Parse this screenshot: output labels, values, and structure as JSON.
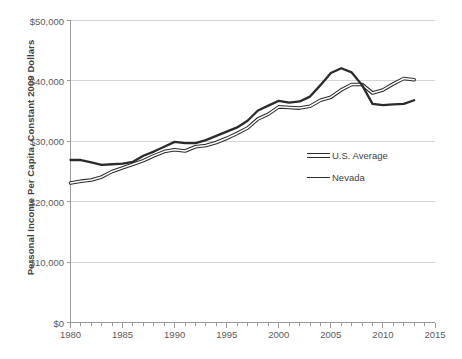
{
  "chart_data": {
    "type": "line",
    "title": "",
    "subtitle": "",
    "xlabel": "",
    "ylabel": "Personal Income Per Capita, Constant 2009 Dollars",
    "xlim": [
      1980,
      2015
    ],
    "ylim": [
      0,
      50000
    ],
    "grid": true,
    "grid_axis": "y",
    "legend_position": "inside-right-middle",
    "y_ticks": [
      0,
      10000,
      20000,
      30000,
      40000,
      50000
    ],
    "y_tick_labels": [
      "$0",
      "$10,000",
      "$20,000",
      "$30,000",
      "$40,000",
      "$50,000"
    ],
    "x_ticks_major": [
      1980,
      1985,
      1990,
      1995,
      2000,
      2005,
      2010,
      2015
    ],
    "x_tick_labels": [
      "1980",
      "1985",
      "1990",
      "1995",
      "2000",
      "2005",
      "2010",
      "2015"
    ],
    "x_minor_tick_interval": 1,
    "x": [
      1980,
      1981,
      1982,
      1983,
      1984,
      1985,
      1986,
      1987,
      1988,
      1989,
      1990,
      1991,
      1992,
      1993,
      1994,
      1995,
      1996,
      1997,
      1998,
      1999,
      2000,
      2001,
      2002,
      2003,
      2004,
      2005,
      2006,
      2007,
      2008,
      2009,
      2010,
      2011,
      2012,
      2013
    ],
    "series": [
      {
        "name": "U.S. Average",
        "style": "hollow-double-line",
        "color": "#2b2b2b",
        "values": [
          23100,
          23400,
          23600,
          24100,
          25000,
          25600,
          26200,
          26800,
          27600,
          28300,
          28600,
          28400,
          29100,
          29300,
          29800,
          30500,
          31300,
          32200,
          33700,
          34500,
          35700,
          35600,
          35500,
          35800,
          36800,
          37300,
          38500,
          39400,
          39400,
          38000,
          38500,
          39500,
          40400,
          40200
        ]
      },
      {
        "name": "Nevada",
        "style": "solid-line",
        "color": "#2b2b2b",
        "values": [
          26900,
          26900,
          26500,
          26100,
          26200,
          26300,
          26600,
          27600,
          28300,
          29100,
          29900,
          29700,
          29700,
          30200,
          30900,
          31600,
          32300,
          33400,
          35100,
          35900,
          36700,
          36400,
          36600,
          37400,
          39300,
          41300,
          42100,
          41400,
          39300,
          36200,
          36000,
          36100,
          36200,
          36800
        ]
      }
    ]
  },
  "legend": {
    "items": [
      {
        "label": "U.S. Average",
        "marker": "hollow-double-line-swatch"
      },
      {
        "label": "Nevada",
        "marker": "solid-line-swatch"
      }
    ]
  },
  "axis": {
    "y_title": "Personal Income Per Capita, Constant 2009 Dollars"
  },
  "colors": {
    "background": "#ffffff",
    "line": "#2b2b2b",
    "gridline": "#d4d4d4",
    "axis": "#9a9a9a",
    "text": "#5b5b5b"
  }
}
